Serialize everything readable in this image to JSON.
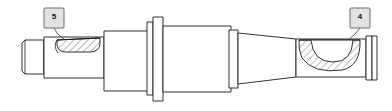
{
  "drawing": {
    "title": "Stepped shaft / spindle assembly section view",
    "type": "mechanical-engineering-part-drawing",
    "projection": "longitudinal half-section side elevation",
    "background_color": "#ffffff",
    "line_color": "#1a1a1a",
    "hatch_color": "#3a3a3a",
    "fill_color": "#ffffff",
    "balloon_fill_color": "#e2e2e2",
    "balloon_border_color": "#6d6d6d"
  },
  "callouts": [
    {
      "id": "balloon-5",
      "number": "5",
      "position": "upper-left",
      "points_to": "keyway slot on left shaft journal",
      "box": {
        "x": 44,
        "y": 8,
        "width": 20,
        "height": 20
      },
      "leader_from": {
        "x": 54,
        "y": 28
      },
      "leader_to": {
        "x": 65,
        "y": 38
      }
    },
    {
      "id": "balloon-4",
      "number": "4",
      "position": "upper-right",
      "points_to": "hatched sectioned crescent groove on right shaft",
      "box": {
        "x": 350,
        "y": 8,
        "width": 20,
        "height": 20
      },
      "leader_from": {
        "x": 360,
        "y": 28
      },
      "leader_to": {
        "x": 347,
        "y": 40
      }
    }
  ],
  "features": [
    {
      "name": "hex-end-block",
      "description": "chamfered square/hex drive end at far left",
      "x_range": [
        19,
        45
      ]
    },
    {
      "name": "left-journal",
      "description": "small diameter shaft journal with keyway",
      "x_range": [
        45,
        104
      ]
    },
    {
      "name": "keyway-slot",
      "description": "rounded-end hatched keyway slot",
      "x_range": [
        56,
        104
      ]
    },
    {
      "name": "left-step-collar",
      "description": "stepped larger diameter collar",
      "x_range": [
        104,
        150
      ]
    },
    {
      "name": "flange",
      "description": "tall thin flange disc",
      "x_range": [
        150,
        162
      ]
    },
    {
      "name": "main-body",
      "description": "large diameter central body",
      "x_range": [
        162,
        230
      ]
    },
    {
      "name": "right-shoulder",
      "description": "narrow shoulder ring right of body",
      "x_range": [
        230,
        238
      ]
    },
    {
      "name": "right-journal",
      "description": "tapered right shaft journal",
      "x_range": [
        238,
        295
      ]
    },
    {
      "name": "groove-section",
      "description": "hatched crescent sectioned groove",
      "x_range": [
        295,
        365
      ]
    },
    {
      "name": "end-ring",
      "description": "thin retaining ring at far right end",
      "x_range": [
        365,
        378
      ]
    }
  ]
}
